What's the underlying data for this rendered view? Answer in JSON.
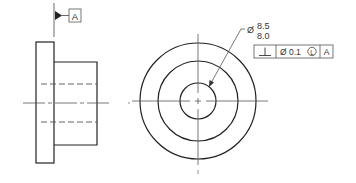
{
  "drawing": {
    "type": "engineering-drawing",
    "views": [
      "side-view",
      "front-view"
    ],
    "colors": {
      "line": "#222222",
      "thin": "#555555",
      "text": "#333333",
      "background": "#ffffff"
    }
  },
  "datum": {
    "label": "A"
  },
  "dimension": {
    "symbol": "Ø",
    "upper_limit": "8.5",
    "lower_limit": "8.0"
  },
  "feature_control_frame": {
    "characteristic_symbol": "⊥",
    "characteristic_name": "perpendicularity",
    "tolerance_symbol": "Ø",
    "tolerance_value": "0.1",
    "modifier": "L",
    "modifier_name": "least-material-condition",
    "datum_reference": "A"
  }
}
